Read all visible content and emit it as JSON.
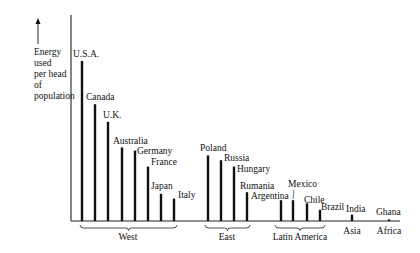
{
  "chart_data": {
    "type": "bar",
    "title": "",
    "xlabel": "",
    "ylabel": "Energy used per head of population",
    "ylabel_lines": [
      "Energy",
      "used",
      "per head",
      "of",
      "population"
    ],
    "y_axis_arrow": true,
    "y_units": "relative (U.S.A. = 100, no numeric ticks shown)",
    "ylim": [
      0,
      100
    ],
    "grid": false,
    "categories": [
      "U.S.A.",
      "Canada",
      "U.K.",
      "Australia",
      "Germany",
      "France",
      "Japan",
      "Italy",
      "Poland",
      "Russia",
      "Hungary",
      "Rumania",
      "Argentina",
      "Mexico",
      "Chile",
      "Brazil",
      "India",
      "Ghana"
    ],
    "values": [
      100,
      73,
      62,
      46,
      44,
      34,
      17,
      14,
      41,
      38,
      34,
      18,
      13,
      13,
      11,
      7,
      4,
      1
    ],
    "groups": [
      {
        "name": "West",
        "members": [
          "U.S.A.",
          "Canada",
          "U.K.",
          "Australia",
          "Germany",
          "France",
          "Japan",
          "Italy"
        ]
      },
      {
        "name": "East",
        "members": [
          "Poland",
          "Russia",
          "Hungary",
          "Rumania"
        ]
      },
      {
        "name": "Latin America",
        "members": [
          "Argentina",
          "Mexico",
          "Chile",
          "Brazil"
        ]
      },
      {
        "name": "Asia",
        "members": [
          "India"
        ]
      },
      {
        "name": "Africa",
        "members": [
          "Ghana"
        ]
      }
    ],
    "bars": [
      {
        "label": "U.S.A.",
        "x": 82,
        "value": 100,
        "lx": 73,
        "ly": 57
      },
      {
        "label": "Canada",
        "x": 95,
        "value": 73,
        "lx": 86,
        "ly": 100
      },
      {
        "label": "U.K.",
        "x": 108,
        "value": 62,
        "lx": 103,
        "ly": 118
      },
      {
        "label": "Australia",
        "x": 122,
        "value": 46,
        "lx": 113,
        "ly": 144
      },
      {
        "label": "Germany",
        "x": 135,
        "value": 44,
        "lx": 137,
        "ly": 154
      },
      {
        "label": "France",
        "x": 148,
        "value": 34,
        "lx": 151,
        "ly": 165
      },
      {
        "label": "Japan",
        "x": 161,
        "value": 17,
        "lx": 151,
        "ly": 189
      },
      {
        "label": "Italy",
        "x": 174,
        "value": 14,
        "lx": 178,
        "ly": 198
      },
      {
        "label": "Poland",
        "x": 208,
        "value": 41,
        "lx": 200,
        "ly": 151
      },
      {
        "label": "Russia",
        "x": 221,
        "value": 38,
        "lx": 224,
        "ly": 161
      },
      {
        "label": "Hungary",
        "x": 234,
        "value": 34,
        "lx": 237,
        "ly": 172
      },
      {
        "label": "Rumania",
        "x": 247,
        "value": 18,
        "lx": 240,
        "ly": 189
      },
      {
        "label": "Argentina",
        "x": 281,
        "value": 13,
        "lx": 251,
        "ly": 199
      },
      {
        "label": "Mexico",
        "x": 293,
        "value": 13,
        "lx": 288,
        "ly": 187
      },
      {
        "label": "Chile",
        "x": 307,
        "value": 11,
        "lx": 304,
        "ly": 203
      },
      {
        "label": "Brazil",
        "x": 320,
        "value": 7,
        "lx": 321,
        "ly": 210
      },
      {
        "label": "India",
        "x": 352,
        "value": 4,
        "lx": 346,
        "ly": 212
      },
      {
        "label": "Ghana",
        "x": 389,
        "value": 1,
        "lx": 376,
        "ly": 215
      }
    ],
    "group_labels": [
      {
        "name": "West",
        "x1": 80,
        "x2": 177,
        "lx": 128
      },
      {
        "name": "East",
        "x1": 205,
        "x2": 250,
        "lx": 227
      },
      {
        "name": "Latin America",
        "x1": 275,
        "x2": 325,
        "lx": 300
      },
      {
        "name": "Asia",
        "x1": 352,
        "x2": 352,
        "lx": 352,
        "no_brace": true
      },
      {
        "name": "Africa",
        "x1": 389,
        "x2": 389,
        "lx": 389,
        "no_brace": true
      }
    ],
    "layout": {
      "axis_x": 71,
      "axis_top": 15,
      "baseline_y": 221,
      "baseline_end_x": 400,
      "full_height_px": 160
    }
  }
}
